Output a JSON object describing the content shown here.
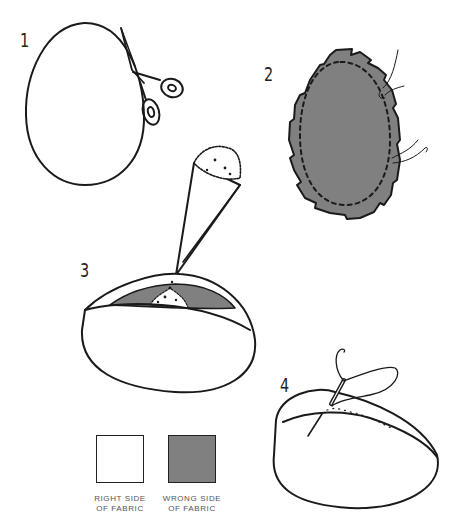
{
  "figure": {
    "title": "",
    "steps": [
      {
        "number": "1",
        "description": "Cut out egg shape with scissors"
      },
      {
        "number": "2",
        "description": "Stitch around edge of fabric, notched seam allowance, thread ends"
      },
      {
        "number": "3",
        "description": "Fill with stuffing through a paper cone funnel"
      },
      {
        "number": "4",
        "description": "Sew the opening closed with needle and thread"
      }
    ],
    "legend": [
      {
        "label_line1": "RIGHT SIDE",
        "label_line2": "OF FABRIC",
        "color": "#ffffff"
      },
      {
        "label_line1": "WRONG SIDE",
        "label_line2": "OF FABRIC",
        "color": "#808080"
      }
    ]
  },
  "colors": {
    "line": "#1a1a1a",
    "wrong_side": "#808080",
    "right_side": "#ffffff",
    "background": "#ffffff"
  }
}
